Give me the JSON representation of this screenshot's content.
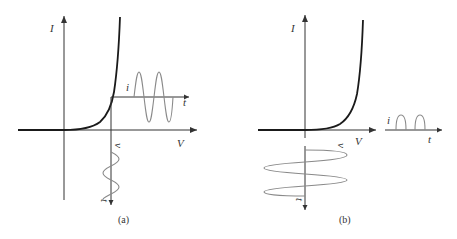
{
  "figure": {
    "panels": [
      {
        "id": "a",
        "caption": "(a)",
        "axis_labels": {
          "y": "I",
          "x": "V"
        },
        "output_labels": {
          "amplitude": "i",
          "time": "t"
        },
        "input_labels": {
          "amplitude": "v",
          "time": "t"
        },
        "description": "Diode I-V characteristic with DC bias; small sinusoidal input voltage produces small sinusoidal output current"
      },
      {
        "id": "b",
        "caption": "(b)",
        "axis_labels": {
          "y": "I",
          "x": "V"
        },
        "output_labels": {
          "amplitude": "i",
          "time": "t"
        },
        "input_labels": {
          "amplitude": "v",
          "time": "t"
        },
        "description": "Diode I-V characteristic with zero bias; large sinusoidal input voltage produces half-wave rectified output current"
      }
    ]
  }
}
